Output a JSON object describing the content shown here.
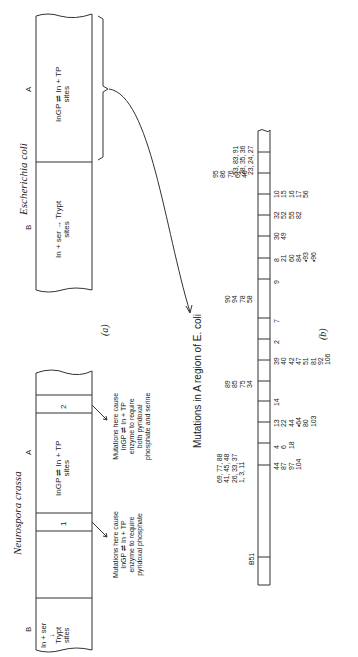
{
  "figure": {
    "panel_a": {
      "label": "(a)",
      "ecoli": {
        "title": "Escherichia coli",
        "region_a": {
          "letter": "A",
          "line1": "InGP ⇌ In + TP",
          "line2": "sites"
        },
        "region_b": {
          "letter": "B",
          "line1": "In + ser → Trypt",
          "line2": "sites"
        }
      },
      "neurospora": {
        "title": "Neurospora crassa",
        "region_a": {
          "letter": "A",
          "line1": "InGP ⇌ In + TP",
          "line2": "sites"
        },
        "region_b": {
          "letter": "B",
          "line1": "In + ser",
          "arrow": "↓",
          "line2": "Trypt",
          "line3": "sites"
        },
        "site1": "1",
        "site2": "2",
        "note1": [
          "Mutations here cause",
          "InGP ⇌ In + TP",
          "enzyme to require",
          "pyridoxal phosphate"
        ],
        "note2": [
          "Mutations here cause",
          "InGP ⇌ In + TP",
          "enzyme to require",
          "both pyridoxal",
          "phosphate and serine"
        ]
      }
    },
    "panel_b": {
      "label": "(b)",
      "title": "Mutations in A region of E. coli",
      "left_groups": [
        {
          "lines": [
            "95",
            "86",
            "76",
            "61",
            "46"
          ]
        },
        {
          "lines": [
            "53, 83, 91",
            "28, 35, 36",
            "23, 24, 27"
          ]
        },
        {
          "lines": [
            "90",
            "94",
            "78",
            "58"
          ]
        },
        {
          "lines": [
            "89",
            "85",
            "75",
            "34"
          ]
        },
        {
          "lines": [
            "69, 77, 88",
            "41, 45, 48",
            "26, 33, 37",
            "1, 3, 11"
          ]
        },
        {
          "lines": [
            "B51"
          ]
        }
      ],
      "right_groups": [
        {
          "lines": [
            "10",
            "15",
            "16",
            "17",
            "56"
          ]
        },
        {
          "lines": [
            "32",
            "52",
            "55",
            "82"
          ]
        },
        {
          "lines": [
            "30",
            "49"
          ]
        },
        {
          "lines": [
            "8",
            "21",
            "60",
            "84",
            "•93",
            "•96"
          ]
        },
        {
          "lines": [
            "9"
          ]
        },
        {
          "lines": [
            "7"
          ]
        },
        {
          "lines": [
            "2"
          ]
        },
        {
          "lines": [
            "39",
            "40",
            "42",
            "47",
            "51",
            "81",
            "92",
            "106"
          ]
        },
        {
          "lines": [
            "14"
          ]
        },
        {
          "lines": [
            "13",
            "22",
            "44",
            "•64",
            "80",
            "103"
          ]
        },
        {
          "lines": [
            "4",
            "6",
            "18"
          ]
        },
        {
          "lines": [
            "44",
            "87",
            "97",
            "104"
          ]
        }
      ]
    }
  }
}
